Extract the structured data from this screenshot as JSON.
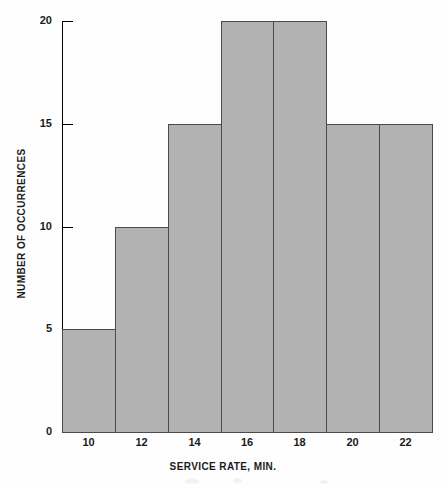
{
  "chart_data": {
    "type": "bar",
    "title": "",
    "xlabel": "SERVICE RATE, MIN.",
    "ylabel": "NUMBER OF OCCURRENCES",
    "categories": [
      "10",
      "12",
      "14",
      "16",
      "18",
      "20",
      "22"
    ],
    "values": [
      5,
      10,
      15,
      20,
      20,
      15,
      15
    ],
    "x_tick_labels": [
      "10",
      "12",
      "14",
      "16",
      "18",
      "20",
      "22"
    ],
    "y_tick_labels": [
      "0",
      "5",
      "10",
      "15",
      "20"
    ],
    "y_tick_values": [
      0,
      5,
      10,
      15,
      20
    ],
    "ylim": [
      0,
      20
    ],
    "xlim": [
      9,
      23
    ],
    "bin_width": 2,
    "bin_edges": [
      9,
      11,
      13,
      15,
      17,
      19,
      21,
      23
    ],
    "grid": false,
    "legend": null,
    "bar_fill_color": "#b2b2b2",
    "bar_edge_color": "#4a4a4a",
    "axis_color": "#000000",
    "background_color": "#ffffff",
    "bars": [
      {
        "label": "10",
        "value": 5,
        "bin_start": 9,
        "bin_end": 11
      },
      {
        "label": "12",
        "value": 10,
        "bin_start": 11,
        "bin_end": 13
      },
      {
        "label": "14",
        "value": 15,
        "bin_start": 13,
        "bin_end": 15
      },
      {
        "label": "16",
        "value": 20,
        "bin_start": 15,
        "bin_end": 17
      },
      {
        "label": "18",
        "value": 20,
        "bin_start": 17,
        "bin_end": 19
      },
      {
        "label": "20",
        "value": 15,
        "bin_start": 19,
        "bin_end": 21
      },
      {
        "label": "22",
        "value": 15,
        "bin_start": 21,
        "bin_end": 23
      }
    ]
  }
}
